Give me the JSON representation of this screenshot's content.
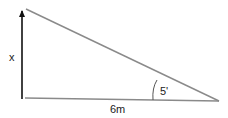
{
  "diagram": {
    "type": "right-triangle",
    "labels": {
      "height": "x",
      "base": "6m",
      "angle": "5'"
    },
    "colors": {
      "hypotenuse": "#8a8a8a",
      "base": "#8a8a8a",
      "height_arrow": "#111111",
      "arc": "#555555"
    }
  }
}
